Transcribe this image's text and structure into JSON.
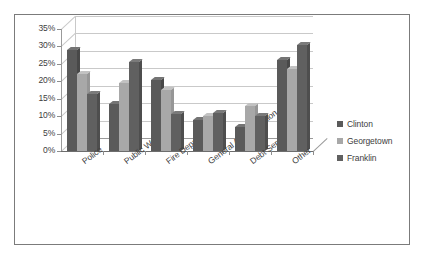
{
  "chart_data": {
    "type": "bar",
    "title": "",
    "subtitle": "",
    "xlabel": "",
    "ylabel": "",
    "categories": [
      "Police",
      "Public Works",
      "Fire Department",
      "General Administration",
      "Debt Service",
      "Other"
    ],
    "series": [
      {
        "name": "Clinton",
        "color": "#5a5a5a",
        "values": [
          29,
          13.5,
          20.5,
          9,
          7,
          26
        ]
      },
      {
        "name": "Georgetown",
        "color": "#a8a8a8",
        "values": [
          22,
          19.5,
          17.5,
          10,
          13,
          23.5
        ]
      },
      {
        "name": "Franklin",
        "color": "#606060",
        "values": [
          16.5,
          25.5,
          10.5,
          11,
          10,
          30.5
        ]
      }
    ],
    "ytick_labels": [
      "0%",
      "5%",
      "10%",
      "15%",
      "20%",
      "25%",
      "30%",
      "35%"
    ],
    "ytick_values": [
      0,
      5,
      10,
      15,
      20,
      25,
      30,
      35
    ],
    "ylim": [
      0,
      35
    ],
    "grid": true,
    "legend_position": "right",
    "three_d": true,
    "plot_background": "#ffffff",
    "gridline_color": "#c9c9c9",
    "frame_border_color": "#7b7b7b"
  }
}
